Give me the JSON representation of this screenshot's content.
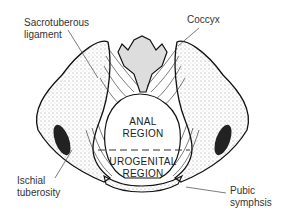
{
  "diagram": {
    "labels": {
      "sacrotuberous_1": "Sacrotuberous",
      "sacrotuberous_2": "ligament",
      "coccyx": "Coccyx",
      "ischial_1": "Ischial",
      "ischial_2": "tuberosity",
      "pubic_1": "Pubic",
      "pubic_2": "symphsis"
    },
    "regions": {
      "anal_1": "ANAL",
      "anal_2": "REGION",
      "urogenital_1": "UROGENITAL",
      "urogenital_2": "REGION"
    },
    "colors": {
      "line": "#111111",
      "label_text": "#333333",
      "background": "#ffffff"
    }
  }
}
